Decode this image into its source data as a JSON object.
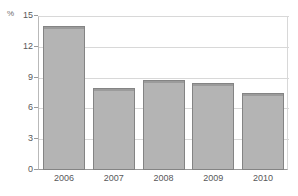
{
  "chart_data": {
    "type": "bar",
    "title": "",
    "subtitle": "",
    "xlabel": "",
    "ylabel": "",
    "unit_label": "%",
    "categories": [
      "2006",
      "2007",
      "2008",
      "2009",
      "2010"
    ],
    "values": [
      14.0,
      8.0,
      8.8,
      8.5,
      7.5
    ],
    "ylim": [
      0,
      15
    ],
    "yticks": [
      0,
      3,
      6,
      9,
      12,
      15
    ],
    "ytick_labels": [
      "0",
      "3",
      "6",
      "9",
      "12",
      "15"
    ],
    "grid": true,
    "grid_axis": "y",
    "legend": false,
    "legend_position": "none",
    "series": [
      {
        "name": "",
        "values": [
          14.0,
          8.0,
          8.8,
          8.5,
          7.5
        ]
      }
    ],
    "colors": {
      "bar_fill": "#b4b4b4",
      "bar_border": "#848484",
      "gridline": "#d8d8d8",
      "axis": "#9a9a9a",
      "tick_text": "#58585a",
      "unit_text": "#6e6e6e",
      "background": "#ffffff"
    }
  }
}
